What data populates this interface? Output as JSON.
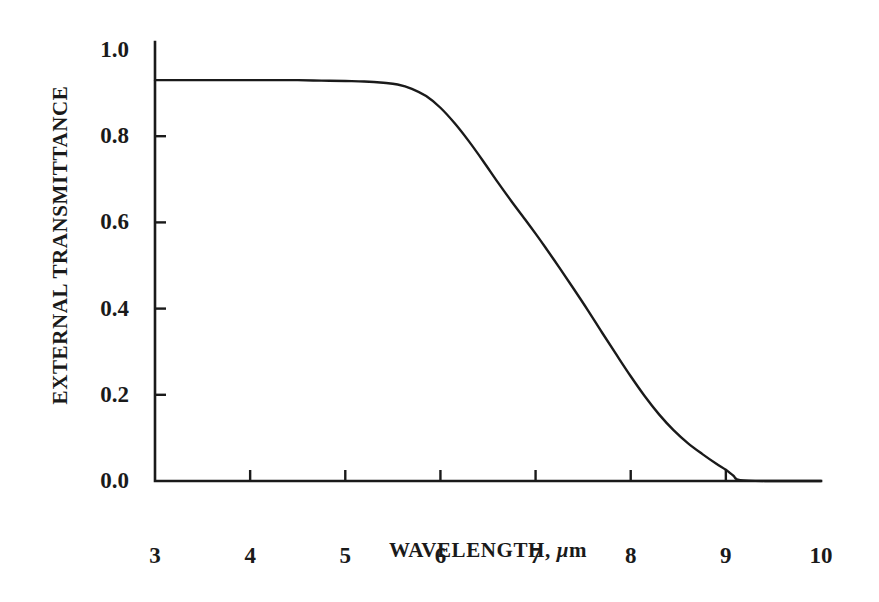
{
  "chart_data": {
    "type": "line",
    "title": "",
    "xlabel": "WAVELENGTH, μm",
    "xlabel_parts": {
      "main": "WAVELENGTH, ",
      "mu": "μ",
      "unit": "m"
    },
    "ylabel": "EXTERNAL TRANSMITTANCE",
    "xlim": [
      3,
      10
    ],
    "ylim": [
      0.0,
      1.0
    ],
    "xticks": [
      3,
      4,
      5,
      6,
      7,
      8,
      9,
      10
    ],
    "xtick_labels": [
      "3",
      "4",
      "5",
      "6",
      "7",
      "8",
      "9",
      "10"
    ],
    "yticks": [
      0.0,
      0.2,
      0.4,
      0.6,
      0.8,
      1.0
    ],
    "ytick_labels": [
      "0.0",
      "0.2",
      "0.4",
      "0.6",
      "0.8",
      "1.0"
    ],
    "grid": false,
    "legend": null,
    "line_color": "#1a1a1a",
    "axis_color": "#1a1a1a",
    "background": "#ffffff",
    "series": [
      {
        "name": "external transmittance",
        "x": [
          3.0,
          3.25,
          3.5,
          3.75,
          4.0,
          4.25,
          4.5,
          4.75,
          5.0,
          5.2,
          5.4,
          5.55,
          5.7,
          5.85,
          6.0,
          6.15,
          6.3,
          6.45,
          6.6,
          6.75,
          6.9,
          7.0,
          7.1,
          7.25,
          7.4,
          7.55,
          7.7,
          7.85,
          8.0,
          8.15,
          8.3,
          8.45,
          8.6,
          8.75,
          8.9,
          9.0,
          9.08,
          9.15,
          9.5,
          10.0
        ],
        "y": [
          0.93,
          0.93,
          0.93,
          0.93,
          0.93,
          0.93,
          0.93,
          0.929,
          0.928,
          0.927,
          0.924,
          0.92,
          0.91,
          0.893,
          0.866,
          0.83,
          0.788,
          0.742,
          0.694,
          0.648,
          0.604,
          0.574,
          0.543,
          0.495,
          0.446,
          0.396,
          0.344,
          0.293,
          0.243,
          0.196,
          0.154,
          0.118,
          0.088,
          0.063,
          0.04,
          0.026,
          0.012,
          0.002,
          0.0,
          0.0
        ]
      }
    ]
  },
  "axes": {
    "ytick_positions_px": [
      481,
      395,
      309,
      222,
      136,
      50
    ],
    "xtick_positions_px": [
      155,
      250,
      345,
      440,
      536,
      631,
      726,
      821
    ]
  }
}
